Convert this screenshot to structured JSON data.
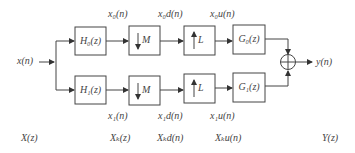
{
  "diagram": {
    "input": "x(n)",
    "output": "y(n)",
    "top_row": {
      "analysis_filter": "H₀(z)",
      "downsampler": "M",
      "upsampler": "L",
      "synthesis_filter": "G₀(z)",
      "signals": [
        "x₀(n)",
        "x₀d(n)",
        "x₀u(n)"
      ]
    },
    "bottom_row": {
      "analysis_filter": "H₁(z)",
      "downsampler": "M",
      "upsampler": "L",
      "synthesis_filter": "G₁(z)",
      "signals": [
        "x₁(n)",
        "x₁d(n)",
        "x₁u(n)"
      ]
    },
    "domain_labels": [
      "X(z)",
      "Xₖ(z)",
      "Xₖd(n)",
      "Xₖu(n)",
      "Y(z)"
    ],
    "adder_symbol": "⊕"
  }
}
